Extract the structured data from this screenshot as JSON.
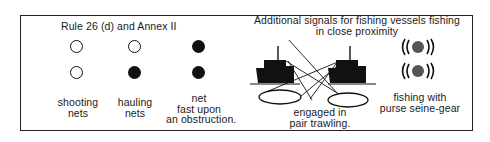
{
  "left_section": {
    "title": "Rule 26 (d) and Annex II",
    "columns": [
      {
        "lights": [
          "white",
          "white"
        ],
        "label_lines": [
          "shooting",
          "nets"
        ]
      },
      {
        "lights": [
          "white",
          "black"
        ],
        "label_lines": [
          "hauling",
          "nets"
        ]
      },
      {
        "lights": [
          "black",
          "black"
        ],
        "label_lines": [
          "net",
          "fast upon",
          "an obstruction."
        ]
      }
    ]
  },
  "right_section": {
    "title_lines": [
      "Additional signals for fishing vessels fishing",
      "in close proximity"
    ],
    "pair_trawling": {
      "label_lines": [
        "engaged in",
        "pair trawling."
      ]
    },
    "purse_seine": {
      "label_lines": [
        "fishing with",
        "purse seine-gear"
      ],
      "light_color": "#555555",
      "flashing": true
    }
  },
  "colors": {
    "ink": "#111111",
    "background": "#ffffff",
    "purse_light": "#555555"
  }
}
